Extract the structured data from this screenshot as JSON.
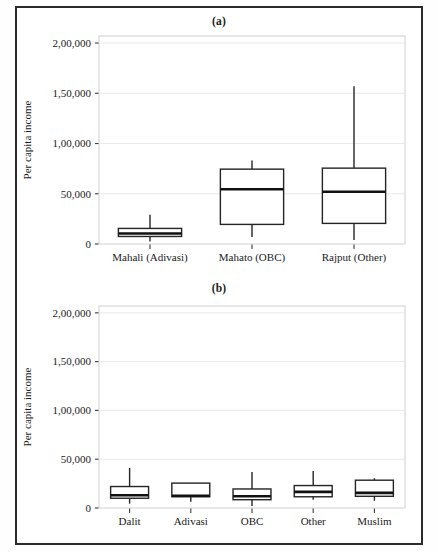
{
  "figure": {
    "panels": [
      {
        "id": "a",
        "title": "(a)",
        "ylabel": "Per capita income",
        "yticks": [
          0,
          50000,
          100000,
          150000,
          200000
        ],
        "ytick_labels": [
          "0",
          "50,000",
          "1,00,000",
          "1,50,000",
          "2,00,000"
        ],
        "ylim": [
          0,
          207000
        ],
        "categories": [
          "Mahali (Adivasi)",
          "Mahato (OBC)",
          "Rajput (Other)"
        ]
      },
      {
        "id": "b",
        "title": "(b)",
        "ylabel": "Per capita income",
        "yticks": [
          0,
          50000,
          100000,
          150000,
          200000
        ],
        "ytick_labels": [
          "0",
          "50,000",
          "1,00,000",
          "1,50,000",
          "2,00,000"
        ],
        "ylim": [
          0,
          207000
        ],
        "categories": [
          "Dalit",
          "Adivasi",
          "OBC",
          "Other",
          "Muslim"
        ]
      }
    ]
  },
  "chart_data": [
    {
      "type": "box",
      "title": "(a)",
      "xlabel": "",
      "ylabel": "Per capita income",
      "ylim": [
        0,
        207000
      ],
      "yticks": [
        0,
        50000,
        100000,
        150000,
        200000
      ],
      "ytick_labels": [
        "0",
        "50,000",
        "1,00,000",
        "1,50,000",
        "2,00,000"
      ],
      "grid": true,
      "legend": "none",
      "categories": [
        "Mahali (Adivasi)",
        "Mahato (OBC)",
        "Rajput (Other)"
      ],
      "boxes": [
        {
          "category": "Mahali (Adivasi)",
          "whisker_low": 2500,
          "q1": 7500,
          "median": 10500,
          "q3": 15500,
          "whisker_high": 29000
        },
        {
          "category": "Mahato (OBC)",
          "whisker_low": 7000,
          "q1": 19500,
          "median": 54500,
          "q3": 74500,
          "whisker_high": 83000
        },
        {
          "category": "Rajput (Other)",
          "whisker_low": 4000,
          "q1": 20500,
          "median": 52000,
          "q3": 75500,
          "whisker_high": 157000
        }
      ]
    },
    {
      "type": "box",
      "title": "(b)",
      "xlabel": "",
      "ylabel": "Per capita income",
      "ylim": [
        0,
        207000
      ],
      "yticks": [
        0,
        50000,
        100000,
        150000,
        200000
      ],
      "ytick_labels": [
        "0",
        "50,000",
        "1,00,000",
        "1,50,000",
        "2,00,000"
      ],
      "grid": true,
      "legend": "none",
      "categories": [
        "Dalit",
        "Adivasi",
        "OBC",
        "Other",
        "Muslim"
      ],
      "boxes": [
        {
          "category": "Dalit",
          "whisker_low": 4500,
          "q1": 10000,
          "median": 13000,
          "q3": 22000,
          "whisker_high": 41000
        },
        {
          "category": "Adivasi",
          "whisker_low": 6500,
          "q1": 11500,
          "median": 12500,
          "q3": 25500,
          "whisker_high": 25500
        },
        {
          "category": "OBC",
          "whisker_low": 2000,
          "q1": 8500,
          "median": 12000,
          "q3": 19500,
          "whisker_high": 37000
        },
        {
          "category": "Other",
          "whisker_low": 8500,
          "q1": 11500,
          "median": 16500,
          "q3": 23000,
          "whisker_high": 38000
        },
        {
          "category": "Muslim",
          "whisker_low": 7500,
          "q1": 12000,
          "median": 15500,
          "q3": 28500,
          "whisker_high": 30500
        }
      ]
    }
  ]
}
